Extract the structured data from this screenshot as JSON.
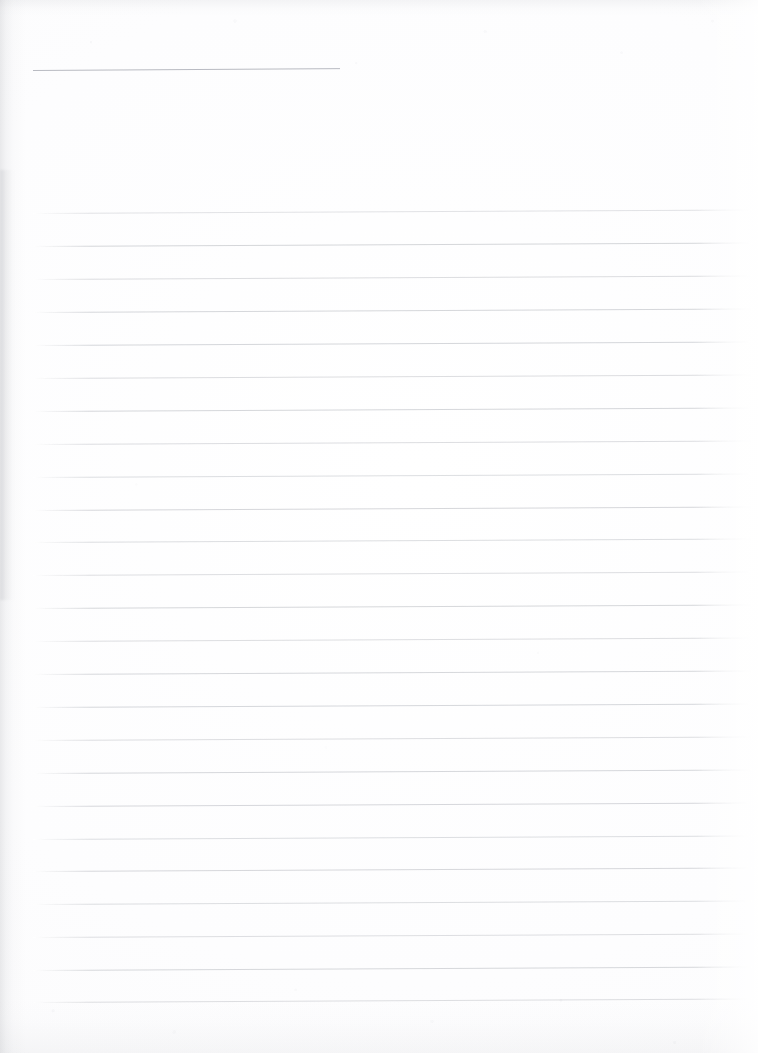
{
  "document": {
    "kind": "scanned-lined-paper",
    "title": "",
    "body_text": "",
    "page_width": 758,
    "page_height": 1053,
    "paper_color": "#fdfdfe",
    "rule_color": "#8a8e98",
    "header_rule_color": "#808493"
  },
  "header_rule": {
    "x": 33,
    "y": 70,
    "width": 307,
    "slant_deg": -0.35,
    "label": ""
  },
  "ruled_lines": {
    "count": 25,
    "first_y": 213,
    "spacing": 32.9,
    "x_start": 33,
    "x_end": 752,
    "slant_deg": -0.28,
    "entries": [
      {
        "index": 1,
        "y": 213,
        "x": 33,
        "width": 719,
        "text": ""
      },
      {
        "index": 2,
        "y": 246,
        "x": 33,
        "width": 719,
        "text": ""
      },
      {
        "index": 3,
        "y": 279,
        "x": 33,
        "width": 719,
        "text": ""
      },
      {
        "index": 4,
        "y": 312,
        "x": 33,
        "width": 719,
        "text": ""
      },
      {
        "index": 5,
        "y": 345,
        "x": 33,
        "width": 719,
        "text": ""
      },
      {
        "index": 6,
        "y": 378,
        "x": 33,
        "width": 719,
        "text": ""
      },
      {
        "index": 7,
        "y": 411,
        "x": 33,
        "width": 719,
        "text": ""
      },
      {
        "index": 8,
        "y": 444,
        "x": 33,
        "width": 719,
        "text": ""
      },
      {
        "index": 9,
        "y": 477,
        "x": 33,
        "width": 719,
        "text": ""
      },
      {
        "index": 10,
        "y": 510,
        "x": 33,
        "width": 719,
        "text": ""
      },
      {
        "index": 11,
        "y": 542,
        "x": 33,
        "width": 719,
        "text": ""
      },
      {
        "index": 12,
        "y": 575,
        "x": 33,
        "width": 719,
        "text": ""
      },
      {
        "index": 13,
        "y": 608,
        "x": 33,
        "width": 719,
        "text": ""
      },
      {
        "index": 14,
        "y": 641,
        "x": 33,
        "width": 719,
        "text": ""
      },
      {
        "index": 15,
        "y": 674,
        "x": 33,
        "width": 719,
        "text": ""
      },
      {
        "index": 16,
        "y": 707,
        "x": 33,
        "width": 719,
        "text": ""
      },
      {
        "index": 17,
        "y": 740,
        "x": 33,
        "width": 719,
        "text": ""
      },
      {
        "index": 18,
        "y": 773,
        "x": 33,
        "width": 719,
        "text": ""
      },
      {
        "index": 19,
        "y": 806,
        "x": 33,
        "width": 719,
        "text": ""
      },
      {
        "index": 20,
        "y": 839,
        "x": 33,
        "width": 719,
        "text": ""
      },
      {
        "index": 21,
        "y": 871,
        "x": 33,
        "width": 719,
        "text": ""
      },
      {
        "index": 22,
        "y": 904,
        "x": 33,
        "width": 719,
        "text": ""
      },
      {
        "index": 23,
        "y": 937,
        "x": 33,
        "width": 719,
        "text": ""
      },
      {
        "index": 24,
        "y": 970,
        "x": 33,
        "width": 719,
        "text": ""
      },
      {
        "index": 25,
        "y": 1002,
        "x": 33,
        "width": 719,
        "text": ""
      }
    ]
  },
  "artifacts": {
    "left_edge_shadow": true,
    "top_edge_shadow": true,
    "bottom_edge_mottle": true,
    "paper_grain": true
  }
}
